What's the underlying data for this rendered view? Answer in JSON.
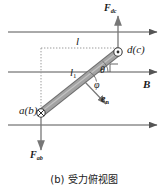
{
  "figure": {
    "caption": "(b) 受力俯视图",
    "type": "force-top-view-diagram"
  },
  "colors": {
    "bar_fill": "#9a9a9a",
    "bar_stroke": "#6e6e6e",
    "line": "#555555",
    "dotted": "#9b9b9b",
    "text": "#1a1a1a",
    "background": "#ffffff"
  },
  "labels": {
    "force_top": "F",
    "force_top_sub": "dc",
    "force_bottom": "F",
    "force_bottom_sub": "ab",
    "node_top": "d(c)",
    "node_bottom": "a(b)",
    "length_full": "l",
    "length_partial": "l",
    "length_partial_sub": "1",
    "angle_theta": "θ",
    "angle_phi": "φ",
    "normal_vector": "e",
    "normal_vector_sub": "n",
    "field": "B"
  },
  "geometry": {
    "field_lines_y": [
      32,
      72,
      125
    ],
    "field_line_x_start": 8,
    "field_line_x_end": 160,
    "bar_start": [
      41,
      113
    ],
    "bar_end": [
      118,
      52
    ],
    "bar_width": 7,
    "marker_top": [
      118,
      52
    ],
    "marker_bottom": [
      41,
      113
    ],
    "dotted_vertical_x": 41,
    "dotted_horizontal_y": 48,
    "force_top_arrow": [
      118,
      52,
      118,
      14
    ],
    "force_bottom_arrow": [
      41,
      113,
      41,
      150
    ],
    "normal_arrow": [
      86,
      83,
      107,
      105
    ],
    "right_angle_corner": [
      118,
      72
    ]
  },
  "annotations": {
    "marker_top_type": "circle-dot-out-of-page",
    "marker_bottom_type": "circle-cross-into-page"
  }
}
